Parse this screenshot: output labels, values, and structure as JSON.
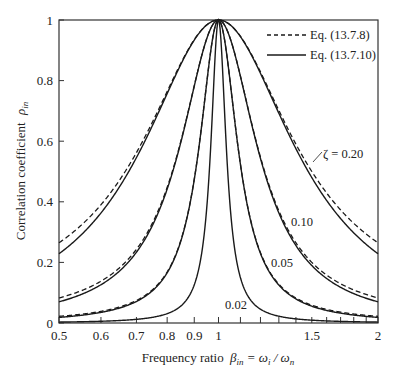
{
  "chart_data": {
    "type": "line",
    "title": "",
    "xlabel": "Frequency ratio β_in = ω_i / ω_n",
    "ylabel": "Correlation coefficient ρ_in",
    "xscale": "log",
    "xlim": [
      0.5,
      2
    ],
    "ylim": [
      0,
      1
    ],
    "grid": false,
    "x_ticks": [
      0.5,
      0.6,
      0.7,
      0.8,
      0.9,
      1,
      1.1,
      1.2,
      1.3,
      1.4,
      1.5,
      1.6,
      1.7,
      1.8,
      1.9,
      2
    ],
    "x_tick_labels": [
      {
        "value": 0.5,
        "label": "0.5"
      },
      {
        "value": 0.6,
        "label": "0.6"
      },
      {
        "value": 0.7,
        "label": "0.7"
      },
      {
        "value": 0.8,
        "label": "0.8"
      },
      {
        "value": 0.9,
        "label": "0.9"
      },
      {
        "value": 1,
        "label": "1"
      },
      {
        "value": 1.5,
        "label": "1.5"
      },
      {
        "value": 2,
        "label": "2"
      }
    ],
    "y_ticks": [
      {
        "value": 0,
        "label": "0"
      },
      {
        "value": 0.2,
        "label": "0.2"
      },
      {
        "value": 0.4,
        "label": "0.4"
      },
      {
        "value": 0.6,
        "label": "0.6"
      },
      {
        "value": 0.8,
        "label": "0.8"
      },
      {
        "value": 1,
        "label": "1"
      }
    ],
    "legend": {
      "position": "upper right",
      "entries": [
        {
          "label": "Eq. (13.7.8)",
          "style": "dashed"
        },
        {
          "label": "Eq. (13.7.10)",
          "style": "solid"
        }
      ]
    },
    "damping_ratios": [
      0.2,
      0.1,
      0.05,
      0.02
    ],
    "curve_labels": [
      {
        "text": "ζ = 0.20",
        "zeta": 0.2
      },
      {
        "text": "0.10",
        "zeta": 0.1
      },
      {
        "text": "0.05",
        "zeta": 0.05
      },
      {
        "text": "0.02",
        "zeta": 0.02
      }
    ],
    "series": [
      {
        "name": "Eq. (13.7.8), ζ=0.20",
        "style": "dashed",
        "x": [
          0.5,
          0.7,
          0.9,
          1,
          1.2,
          1.5,
          2
        ],
        "values": [
          0.265,
          0.5,
          0.9,
          1.0,
          0.8,
          0.49,
          0.265
        ]
      },
      {
        "name": "Eq. (13.7.10), ζ=0.20",
        "style": "solid",
        "x": [
          0.5,
          0.7,
          0.9,
          1,
          1.2,
          1.5,
          2
        ],
        "values": [
          0.229,
          0.46,
          0.89,
          1.0,
          0.78,
          0.45,
          0.229
        ]
      },
      {
        "name": "Eq. (13.7.8), ζ=0.10",
        "style": "dashed",
        "x": [
          0.5,
          0.7,
          0.9,
          1,
          1.2,
          1.5,
          2
        ],
        "values": [
          0.083,
          0.2,
          0.69,
          1.0,
          0.5,
          0.19,
          0.083
        ]
      },
      {
        "name": "Eq. (13.7.10), ζ=0.10",
        "style": "solid",
        "x": [
          0.5,
          0.7,
          0.9,
          1,
          1.2,
          1.5,
          2
        ],
        "values": [
          0.069,
          0.18,
          0.68,
          1.0,
          0.48,
          0.17,
          0.069
        ]
      },
      {
        "name": "Eq. (13.7.8), ζ=0.05",
        "style": "dashed",
        "x": [
          0.5,
          0.7,
          0.9,
          1,
          1.2,
          1.5,
          2
        ],
        "values": [
          0.022,
          0.058,
          0.36,
          1.0,
          0.2,
          0.055,
          0.022
        ]
      },
      {
        "name": "Eq. (13.7.10), ζ=0.05",
        "style": "solid",
        "x": [
          0.5,
          0.7,
          0.9,
          1,
          1.2,
          1.5,
          2
        ],
        "values": [
          0.018,
          0.05,
          0.35,
          1.0,
          0.19,
          0.048,
          0.018
        ]
      },
      {
        "name": "Eq. (13.7.8), ζ=0.02",
        "style": "dashed",
        "x": [
          0.5,
          0.7,
          0.9,
          1,
          1.2,
          1.5,
          2
        ],
        "values": [
          0.0036,
          0.0097,
          0.083,
          1.0,
          0.038,
          0.0093,
          0.0036
        ]
      },
      {
        "name": "Eq. (13.7.10), ζ=0.02",
        "style": "solid",
        "x": [
          0.5,
          0.7,
          0.9,
          1,
          1.2,
          1.5,
          2
        ],
        "values": [
          0.003,
          0.008,
          0.08,
          1.0,
          0.036,
          0.008,
          0.003
        ]
      }
    ]
  },
  "labels": {
    "ylabel_main": "Correlation coefficient",
    "ylabel_symbol": "ρ",
    "ylabel_sub": "in",
    "xlabel_main": "Frequency ratio",
    "xlabel_symbol": "β",
    "xlabel_sub": "in",
    "xlabel_eq": " = ω",
    "xlabel_sub_i": "i",
    "xlabel_slash": " / ω",
    "xlabel_sub_n": "n"
  },
  "style": {
    "line_color": "#1a1a1a",
    "frame_color": "#333333",
    "background": "#ffffff"
  }
}
